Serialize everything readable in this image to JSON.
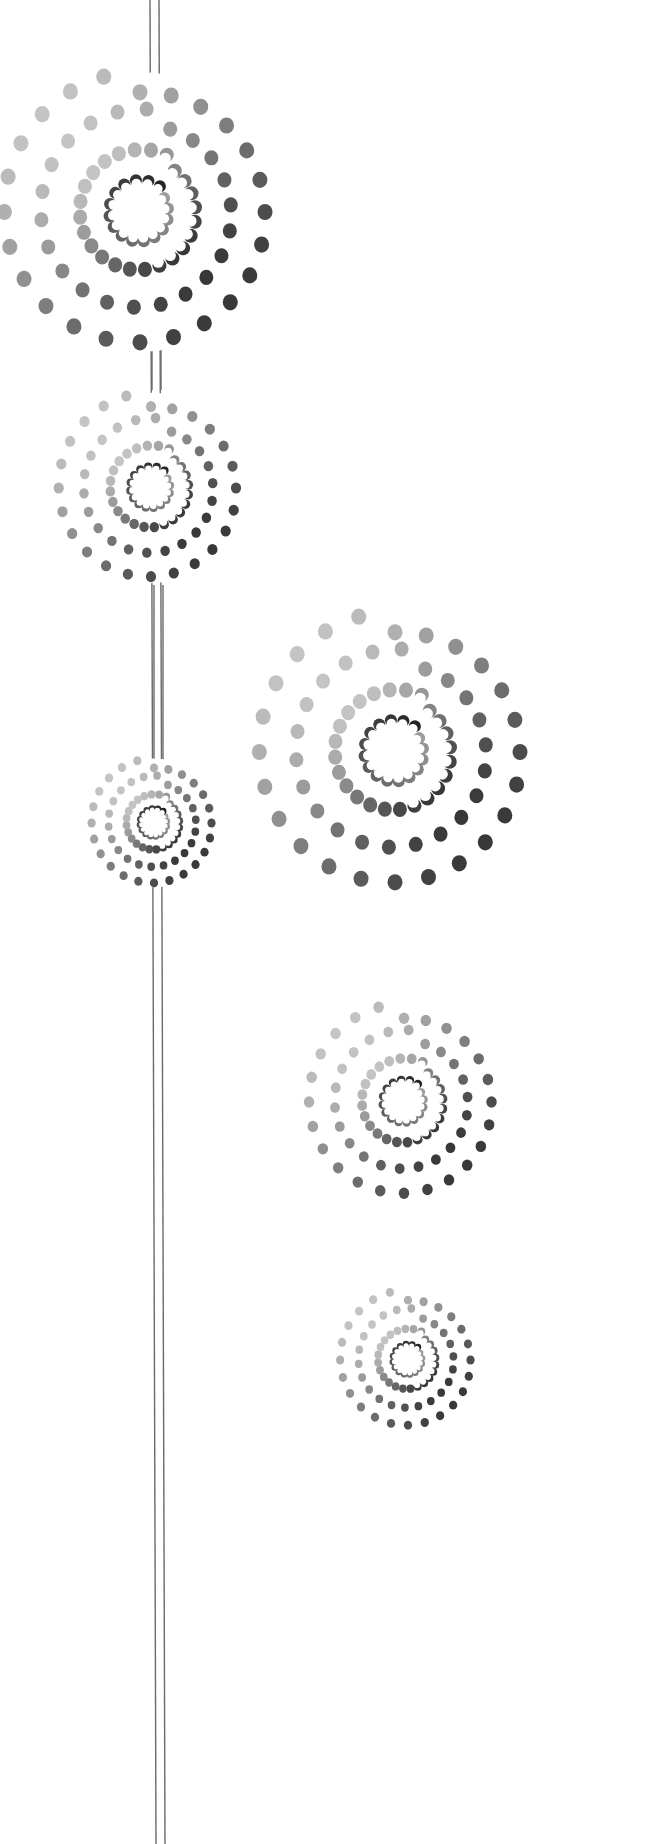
{
  "artwork": {
    "title": "Hanging spiral dot medallions",
    "background": "#ffffff",
    "line_color": "#6a6a6a",
    "dot_light": "#d4d4d4",
    "dot_dark": "#1c1c1c",
    "hangers": [
      {
        "name": "hanger-main-left",
        "x1": 150,
        "y1": 0,
        "x2": 156,
        "y2": 1844,
        "gap": 9
      },
      {
        "name": "hanger-m1-m2",
        "x1": 152,
        "y1": 345,
        "x2": 152,
        "y2": 390,
        "gap": 9
      },
      {
        "name": "hanger-m2-m3",
        "x1": 154,
        "y1": 585,
        "x2": 154,
        "y2": 760,
        "gap": 9
      }
    ],
    "medallions": [
      {
        "name": "medallion-large-top-left",
        "cx": 140,
        "cy": 212,
        "scale": 1.0
      },
      {
        "name": "medallion-medium-left",
        "cx": 151,
        "cy": 488,
        "scale": 0.68
      },
      {
        "name": "medallion-small-left",
        "cx": 154,
        "cy": 823,
        "scale": 0.46
      },
      {
        "name": "medallion-large-right",
        "cx": 395,
        "cy": 752,
        "scale": 1.0
      },
      {
        "name": "medallion-medium-right",
        "cx": 404,
        "cy": 1102,
        "scale": 0.7
      },
      {
        "name": "medallion-small-right",
        "cx": 408,
        "cy": 1360,
        "scale": 0.5
      }
    ],
    "rings": [
      {
        "radius": 133,
        "count": 24,
        "dot_r": 7.5,
        "shape": "dot"
      },
      {
        "radius": 98,
        "count": 22,
        "dot_r": 7,
        "shape": "dot"
      },
      {
        "radius": 60,
        "count": 24,
        "dot_r": 7,
        "shape": "dot"
      },
      {
        "radius": 31,
        "count": 16,
        "dot_r": 6,
        "shape": "crescent"
      }
    ]
  }
}
